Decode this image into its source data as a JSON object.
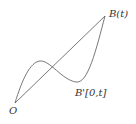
{
  "diagram": {
    "labels": {
      "origin": "O",
      "endpoint": "B(t)",
      "path": "B'[0,t]"
    },
    "colors": {
      "stroke": "#555555",
      "text": "#333333",
      "background": "#ffffff"
    },
    "elements": [
      {
        "type": "straight-segment",
        "from": "O",
        "to": "B(t)"
      },
      {
        "type": "curved-path",
        "from": "O",
        "to": "B(t)",
        "label": "B'[0,t]"
      }
    ]
  }
}
